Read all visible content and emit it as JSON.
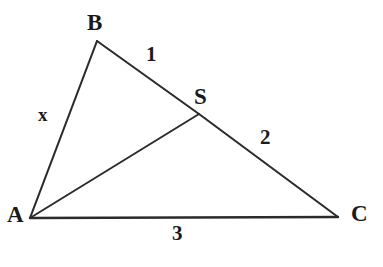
{
  "figure": {
    "kind": "geometry-diagram",
    "canvas": {
      "width": 383,
      "height": 267
    },
    "background_color": "#ffffff",
    "stroke_color": "#2b2b2b",
    "text_color": "#1a1a1a",
    "points": {
      "A": {
        "label": "A",
        "x": 30,
        "y": 218
      },
      "B": {
        "label": "B",
        "x": 97,
        "y": 41
      },
      "C": {
        "label": "C",
        "x": 338,
        "y": 217
      },
      "S": {
        "label": "S",
        "x": 199,
        "y": 114
      }
    },
    "segments": [
      {
        "name": "AB",
        "from": "A",
        "to": "B",
        "label": "x"
      },
      {
        "name": "BS",
        "from": "B",
        "to": "S",
        "label": "1"
      },
      {
        "name": "SC",
        "from": "S",
        "to": "C",
        "label": "2"
      },
      {
        "name": "AC",
        "from": "A",
        "to": "C",
        "label": "3"
      },
      {
        "name": "AS",
        "from": "A",
        "to": "S",
        "label": ""
      }
    ],
    "labels": {
      "vertex_a": "A",
      "vertex_b": "B",
      "vertex_c": "C",
      "point_s": "S",
      "side_ab": "x",
      "side_bs": "1",
      "side_sc": "2",
      "side_ac": "3"
    }
  }
}
